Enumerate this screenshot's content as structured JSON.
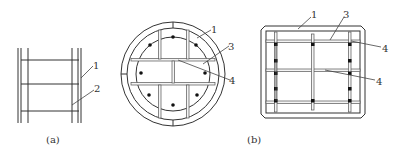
{
  "figure": {
    "panels": [
      {
        "id": "a",
        "caption": "(a)",
        "description": "Side elevation of steel casing with inner reinforcement cage",
        "callouts": [
          {
            "number": "1",
            "target": "steel casing wall"
          },
          {
            "number": "2",
            "target": "reinforcement cage / stirrup"
          }
        ]
      },
      {
        "id": "b",
        "caption": "(b)",
        "description": "Cross sections: circular and square casing with inner cross-shaped stiffener plates and longitudinal rebars",
        "callouts_circle": [
          {
            "number": "1",
            "target": "outer casing"
          },
          {
            "number": "3",
            "target": "stiffener plate"
          },
          {
            "number": "4",
            "target": "longitudinal rebar"
          }
        ],
        "callouts_square": [
          {
            "number": "1",
            "target": "outer casing"
          },
          {
            "number": "3",
            "target": "stiffener plate"
          },
          {
            "number": "4",
            "target": "longitudinal rebar (top)"
          },
          {
            "number": "4",
            "target": "longitudinal rebar (middle)"
          }
        ]
      }
    ]
  },
  "labels": {
    "a_1": "1",
    "a_2": "2",
    "a_caption": "(a)",
    "b_circle_1": "1",
    "b_circle_3": "3",
    "b_circle_4": "4",
    "b_square_1": "1",
    "b_square_3": "3",
    "b_square_4_top": "4",
    "b_square_4_mid": "4",
    "b_caption": "(b)"
  },
  "colors": {
    "line": "#333333",
    "rebar": "#111111",
    "background": "#ffffff"
  }
}
